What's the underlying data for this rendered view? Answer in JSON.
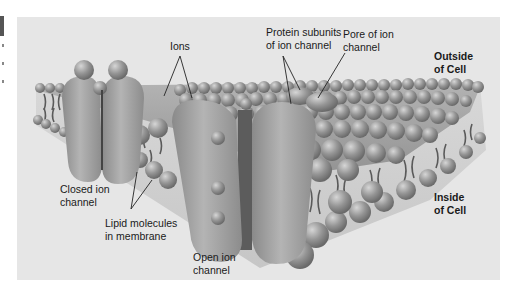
{
  "diagram": {
    "labels": {
      "ions": "Ions",
      "protein_subunits_line1": "Protein subunits",
      "protein_subunits_line2": "of ion channel",
      "pore_line1": "Pore of ion",
      "pore_line2": "channel",
      "outside_line1": "Outside",
      "outside_line2": "of Cell",
      "inside_line1": "Inside",
      "inside_line2": "of Cell",
      "closed_line1": "Closed ion",
      "closed_line2": "channel",
      "lipid_line1": "Lipid molecules",
      "lipid_line2": "in membrane",
      "open_line1": "Open ion",
      "open_line2": "channel"
    },
    "colors": {
      "panel_background": "#e6e6e6",
      "lipid_head": "#8f8f8f",
      "lipid_head_highlight": "#c8c8c8",
      "protein": "#9a9a9a",
      "protein_highlight": "#bdbdbd",
      "tail": "#5a5a5a",
      "label_text": "#1a1a1a",
      "leader_line": "#222222"
    },
    "components": [
      "closed-ion-channel",
      "open-ion-channel",
      "lipid-bilayer",
      "ions",
      "pore"
    ]
  }
}
